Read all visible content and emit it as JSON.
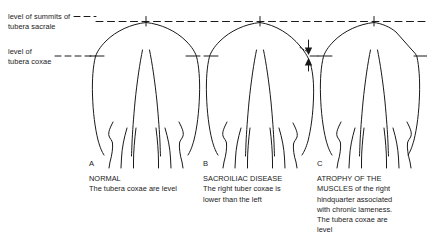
{
  "figure": {
    "background_color": "#ffffff",
    "line_color": "#1a1a1a"
  },
  "level_lines": [
    {
      "id": "sacrale",
      "label_line_1": "level of summits of",
      "label_line_2": "tubera sacrale",
      "style": "dashed"
    },
    {
      "id": "coxae",
      "label_line_1": "level of",
      "label_line_2": "tubera coxae",
      "style": "dashed"
    }
  ],
  "panels": [
    {
      "letter": "A",
      "heading": "NORMAL",
      "lines": [
        "The tubera coxae are level"
      ],
      "condition": "normal",
      "tuber_coxae_symmetry": "level",
      "croup_shape": "rounded-symmetric",
      "has_drop_arrows": false
    },
    {
      "letter": "B",
      "heading": "SACROILIAC DISEASE",
      "lines": [
        "The right tuber coxae is",
        "lower than the left"
      ],
      "condition": "sacroiliac-disease",
      "tuber_coxae_symmetry": "right-lower",
      "croup_shape": "asymmetric-right-dropped",
      "has_drop_arrows": true,
      "arrow_annotation": "vertical drop between left and right tuber coxae levels"
    },
    {
      "letter": "C",
      "heading": "ATROPHY OF THE",
      "lines": [
        "MUSCLES of the right",
        "hindquarter associated",
        "with chronic lameness.",
        "The tubera coxae are",
        "level"
      ],
      "condition": "muscle-atrophy",
      "tuber_coxae_symmetry": "level",
      "croup_shape": "right-side-flattened",
      "has_drop_arrows": false
    }
  ]
}
